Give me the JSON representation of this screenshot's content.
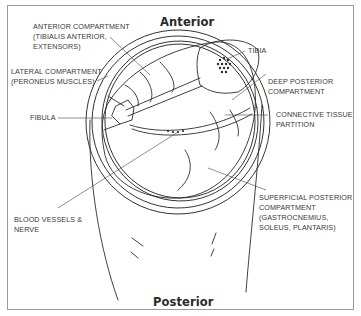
{
  "diagram": {
    "title_top": "Anterior",
    "title_bottom": "Posterior",
    "labels": [
      {
        "id": "anterior-compartment",
        "lines": [
          "Anterior Compartment",
          "(Tibialis Anterior,",
          "Extensors)"
        ]
      },
      {
        "id": "lateral-compartment",
        "lines": [
          "Lateral Compartment",
          "(Peroneus Muscles)"
        ]
      },
      {
        "id": "fibula",
        "lines": [
          "Fibula"
        ]
      },
      {
        "id": "blood-vessels-nerve",
        "lines": [
          "Blood Vessels &",
          "Nerve"
        ]
      },
      {
        "id": "tibia",
        "lines": [
          "Tibia"
        ]
      },
      {
        "id": "deep-posterior-compartment",
        "lines": [
          "Deep Posterior",
          "Compartment"
        ]
      },
      {
        "id": "connective-tissue-partition",
        "lines": [
          "Connective Tissue",
          "Partition"
        ]
      },
      {
        "id": "superficial-posterior-compartment",
        "lines": [
          "Superficial Posterior",
          "Compartment",
          "(Gastrocnemius,",
          "Soleus, Plantaris)"
        ]
      }
    ],
    "colors": {
      "line": "#2b2b2b",
      "text": "#3a3a3a",
      "frame": "#9a9a9a",
      "background": "#ffffff"
    }
  }
}
